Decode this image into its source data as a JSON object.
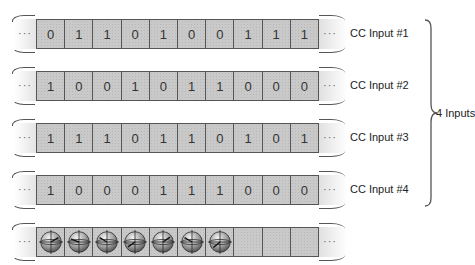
{
  "diagram": {
    "tapes": [
      {
        "label": "CC Input #1",
        "bits": [
          "0",
          "1",
          "1",
          "0",
          "1",
          "0",
          "0",
          "1",
          "1",
          "1"
        ]
      },
      {
        "label": "CC Input #2",
        "bits": [
          "1",
          "0",
          "0",
          "1",
          "0",
          "1",
          "1",
          "0",
          "0",
          "0"
        ]
      },
      {
        "label": "CC Input #3",
        "bits": [
          "1",
          "1",
          "1",
          "0",
          "1",
          "1",
          "0",
          "1",
          "0",
          "1"
        ]
      },
      {
        "label": "CC Input #4",
        "bits": [
          "1",
          "0",
          "0",
          "0",
          "1",
          "1",
          "1",
          "0",
          "0",
          "0"
        ]
      }
    ],
    "ellipsis": "···",
    "group_label": "4 Inputs",
    "qubit_tape": {
      "cells_total": 10,
      "sphere_cells": 7,
      "sphere_icon": "bloch-sphere-icon",
      "sphere_angles": [
        30,
        160,
        150,
        215,
        35,
        150,
        220
      ]
    }
  }
}
